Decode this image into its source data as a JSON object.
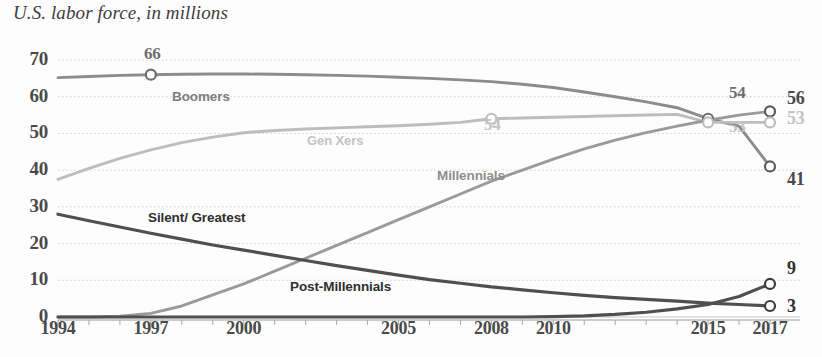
{
  "chart_data": {
    "type": "line",
    "title": "U.S. labor force, in millions",
    "xlabel": "",
    "ylabel": "",
    "grid": true,
    "legend_position": "inline-labels",
    "xlim": [
      1994,
      2017
    ],
    "ylim": [
      0,
      70
    ],
    "yticks": [
      70,
      60,
      50,
      40,
      30,
      20,
      10,
      0
    ],
    "xticks": [
      1994,
      1997,
      2000,
      2005,
      2008,
      2010,
      2015,
      2017
    ],
    "colors": {
      "boomers": "#8c8c8c",
      "gen_xers": "#bdbdbd",
      "millennials": "#9a9a9a",
      "silent_greatest": "#4f4f4f",
      "post_millennials": "#4f4f4f",
      "grid": "#c9c9c9",
      "text": "#4a4a4a"
    },
    "series": [
      {
        "name": "Boomers",
        "label": "Boomers",
        "color": "#8c8c8c",
        "x": [
          1994,
          1995,
          1996,
          1997,
          1998,
          1999,
          2000,
          2001,
          2002,
          2003,
          2004,
          2005,
          2006,
          2007,
          2008,
          2009,
          2010,
          2011,
          2012,
          2013,
          2014,
          2015,
          2016,
          2017
        ],
        "values": [
          65.2,
          65.5,
          65.8,
          66.0,
          66.1,
          66.2,
          66.2,
          66.1,
          66.0,
          65.8,
          65.6,
          65.3,
          65.0,
          64.6,
          64.1,
          63.4,
          62.5,
          61.3,
          60.0,
          58.6,
          57.0,
          54.0,
          52.0,
          41.0
        ]
      },
      {
        "name": "Gen Xers",
        "label": "Gen Xers",
        "color": "#bdbdbd",
        "x": [
          1994,
          1995,
          1996,
          1997,
          1998,
          1999,
          2000,
          2001,
          2002,
          2003,
          2004,
          2005,
          2006,
          2007,
          2008,
          2009,
          2010,
          2011,
          2012,
          2013,
          2014,
          2015,
          2016,
          2017
        ],
        "values": [
          37.5,
          40.5,
          43.2,
          45.5,
          47.5,
          49.0,
          50.2,
          50.8,
          51.2,
          51.5,
          51.8,
          52.1,
          52.5,
          53.0,
          54.0,
          54.2,
          54.4,
          54.6,
          54.8,
          55.0,
          55.2,
          53.0,
          53.0,
          53.0
        ]
      },
      {
        "name": "Millennials",
        "label": "Millennials",
        "color": "#9a9a9a",
        "x": [
          1994,
          1995,
          1996,
          1997,
          1998,
          1999,
          2000,
          2001,
          2002,
          2003,
          2004,
          2005,
          2006,
          2007,
          2008,
          2009,
          2010,
          2011,
          2012,
          2013,
          2014,
          2015,
          2016,
          2017
        ],
        "values": [
          0.0,
          0.0,
          0.2,
          1.0,
          3.0,
          6.0,
          9.0,
          12.5,
          16.0,
          19.5,
          23.0,
          26.5,
          30.0,
          33.5,
          37.0,
          40.0,
          43.0,
          45.8,
          48.2,
          50.2,
          52.0,
          53.6,
          55.0,
          56.0
        ]
      },
      {
        "name": "Silent/Greatest",
        "label": "Silent/ Greatest",
        "color": "#4f4f4f",
        "x": [
          1994,
          1995,
          1996,
          1997,
          1998,
          1999,
          2000,
          2001,
          2002,
          2003,
          2004,
          2005,
          2006,
          2007,
          2008,
          2009,
          2010,
          2011,
          2012,
          2013,
          2014,
          2015,
          2016,
          2017
        ],
        "values": [
          28.0,
          26.2,
          24.5,
          22.8,
          21.2,
          19.6,
          18.2,
          16.8,
          15.4,
          14.0,
          12.7,
          11.4,
          10.2,
          9.2,
          8.2,
          7.4,
          6.6,
          5.9,
          5.3,
          4.8,
          4.3,
          3.8,
          3.4,
          3.0
        ]
      },
      {
        "name": "Post-Millennials",
        "label": "Post-Millennials",
        "color": "#4f4f4f",
        "x": [
          1994,
          1995,
          1996,
          1997,
          1998,
          1999,
          2000,
          2001,
          2002,
          2003,
          2004,
          2005,
          2006,
          2007,
          2008,
          2009,
          2010,
          2011,
          2012,
          2013,
          2014,
          2015,
          2016,
          2017
        ],
        "values": [
          0.0,
          0.0,
          0.0,
          0.0,
          0.0,
          0.0,
          0.0,
          0.0,
          0.0,
          0.0,
          0.0,
          0.0,
          0.0,
          0.0,
          0.0,
          0.0,
          0.1,
          0.3,
          0.7,
          1.3,
          2.2,
          3.4,
          5.6,
          9.0
        ]
      }
    ],
    "annotations": [
      {
        "id": "boomers-peak",
        "text": "66",
        "year": 1997,
        "value": 66,
        "color": "#6e6e6e",
        "marker": true
      },
      {
        "id": "genx-2008",
        "text": "54",
        "year": 2008,
        "value": 54,
        "color": "#bdbdbd",
        "marker": true
      },
      {
        "id": "boomers-2015",
        "text": "54",
        "year": 2015,
        "value": 54,
        "color": "#6e6e6e",
        "marker": true
      },
      {
        "id": "genx-2015",
        "text": "53",
        "year": 2015,
        "value": 53,
        "color": "#bdbdbd",
        "marker": true
      },
      {
        "id": "millennials-end",
        "text": "56",
        "year": 2017,
        "value": 56,
        "color": "#5a5a5a",
        "marker": true
      },
      {
        "id": "genx-end",
        "text": "53",
        "year": 2017,
        "value": 53,
        "color": "#bdbdbd",
        "marker": true
      },
      {
        "id": "boomers-end",
        "text": "41",
        "year": 2017,
        "value": 41,
        "color": "#5a5a5a",
        "marker": true
      },
      {
        "id": "postmillennials-end",
        "text": "9",
        "year": 2017,
        "value": 9,
        "color": "#3d3d3d",
        "marker": true
      },
      {
        "id": "silent-end",
        "text": "3",
        "year": 2017,
        "value": 3,
        "color": "#3d3d3d",
        "marker": true
      }
    ]
  },
  "axis": {
    "ytick_labels": [
      "70",
      "60",
      "50",
      "40",
      "30",
      "20",
      "10",
      "0"
    ],
    "xtick_labels": [
      "1994",
      "1997",
      "2000",
      "2005",
      "2008",
      "2010",
      "2015",
      "2017"
    ]
  },
  "series_labels": {
    "boomers": "Boomers",
    "gen_xers": "Gen Xers",
    "millennials": "Millennials",
    "silent_greatest": "Silent/ Greatest",
    "post_millennials": "Post-Millennials"
  },
  "end_labels": {
    "millennials": "56",
    "gen_xers": "53",
    "boomers": "41",
    "post_millennials": "9",
    "silent_greatest": "3"
  },
  "point_labels": {
    "boomers_peak": "66",
    "genx_2008": "54",
    "boomers_2015": "54",
    "genx_2015": "53"
  }
}
